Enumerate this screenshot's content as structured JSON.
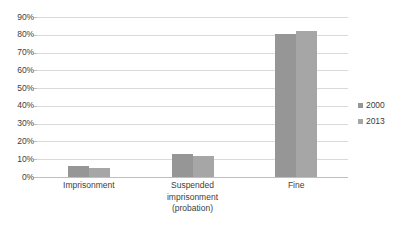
{
  "chart_data": {
    "type": "bar",
    "title": "",
    "subtitle": "",
    "xlabel": "",
    "ylabel": "",
    "categories": [
      "Imprisonment",
      "Suspended imprisonment (probation)",
      "Fine"
    ],
    "category_lines": [
      [
        "Imprisonment"
      ],
      [
        "Suspended",
        "imprisonment",
        "(probation)"
      ],
      [
        "Fine"
      ]
    ],
    "series": [
      {
        "name": "2000",
        "values": [
          6,
          13,
          80.5
        ],
        "color": "#969696"
      },
      {
        "name": "2013",
        "values": [
          5,
          12,
          82
        ],
        "color": "#a6a6a6"
      }
    ],
    "ylim": [
      0,
      90
    ],
    "ytick_values": [
      0,
      10,
      20,
      30,
      40,
      50,
      60,
      70,
      80,
      90
    ],
    "ytick_labels": [
      "0%",
      "10%",
      "20%",
      "30%",
      "40%",
      "50%",
      "60%",
      "70%",
      "80%",
      "90%"
    ],
    "grid": true,
    "grid_color": "#d9d9d9",
    "axis_color": "#bfbfbf",
    "legend_position": "right",
    "value_suffix": "%",
    "background": "#ffffff",
    "text_color": "#404040"
  },
  "legend": {
    "entries": [
      {
        "label": "2000",
        "marker": "square-swatch-dark"
      },
      {
        "label": "2013",
        "marker": "square-swatch-light"
      }
    ]
  }
}
